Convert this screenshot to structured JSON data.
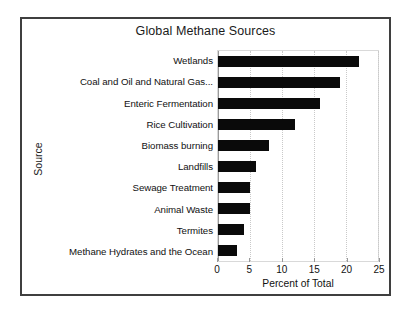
{
  "chart_data": {
    "type": "bar",
    "orientation": "horizontal",
    "title": "Global Methane Sources",
    "xlabel": "Percent of Total",
    "ylabel": "Source",
    "categories": [
      "Wetlands",
      "Coal and Oil and Natural Gas...",
      "Enteric Fermentation",
      "Rice Cultivation",
      "Biomass burning",
      "Landfills",
      "Sewage Treatment",
      "Animal Waste",
      "Termites",
      "Methane Hydrates and the Ocean"
    ],
    "values": [
      22,
      19,
      16,
      12,
      8,
      6,
      5,
      5,
      4,
      3
    ],
    "xlim": [
      0,
      25
    ],
    "xticks": [
      0,
      5,
      10,
      15,
      20,
      25
    ],
    "xtick_labels": [
      "0",
      "5",
      "10",
      "15",
      "20",
      "25"
    ],
    "grid": true,
    "legend": false,
    "bar_color": "#0a0a0a",
    "plot_border_color": "#d9d9d9",
    "frame_color": "#3f3f3f",
    "background_color": "#ffffff"
  }
}
